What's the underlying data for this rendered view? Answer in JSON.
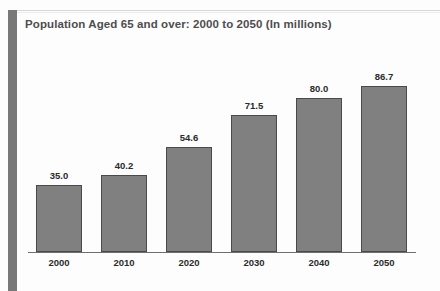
{
  "figure": {
    "title": "Population Aged 65 and over: 2000 to 2050 (In millions)",
    "accent_color": "#787878",
    "bar_color": "#808080",
    "bar_outline_color": "#4a4a4a",
    "background_color": "#fdfdfd",
    "text_color": "#2b2b2b",
    "title_color": "#4d4d4d"
  },
  "chart_data": {
    "type": "bar",
    "title": "Population Aged 65 and over: 2000 to 2050 (In millions)",
    "xlabel": "",
    "ylabel": "",
    "categories": [
      "2000",
      "2010",
      "2020",
      "2030",
      "2040",
      "2050"
    ],
    "values": [
      35.0,
      40.2,
      54.6,
      71.5,
      80.0,
      86.7
    ],
    "value_labels": [
      "35.0",
      "40.2",
      "54.6",
      "71.5",
      "80.0",
      "86.7"
    ],
    "ylim": [
      0,
      100
    ],
    "grid": false,
    "legend": null,
    "series": [
      {
        "name": "Population aged 65 and over",
        "values": [
          35.0,
          40.2,
          54.6,
          71.5,
          80.0,
          86.7
        ]
      }
    ]
  }
}
